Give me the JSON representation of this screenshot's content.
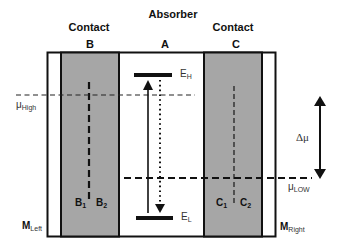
{
  "diagram": {
    "headers": {
      "absorber": "Absorber",
      "contact_left": "Contact",
      "contact_right": "Contact"
    },
    "regions": {
      "B": "B",
      "A": "A",
      "C": "C"
    },
    "energy_levels": {
      "high": {
        "main": "E",
        "sub": "H"
      },
      "low": {
        "main": "E",
        "sub": "L"
      }
    },
    "chemical_potentials": {
      "high": {
        "main": "μ",
        "sub": "High"
      },
      "low": {
        "main": "μ",
        "sub": "LOW"
      },
      "delta": "Δμ"
    },
    "sub_regions": {
      "B1": {
        "main": "B",
        "sub": "1"
      },
      "B2": {
        "main": "B",
        "sub": "2"
      },
      "C1": {
        "main": "C",
        "sub": "1"
      },
      "C2": {
        "main": "C",
        "sub": "2"
      }
    },
    "metals": {
      "left": {
        "main": "M",
        "sub": "Left"
      },
      "right": {
        "main": "M",
        "sub": "Right"
      }
    },
    "colors": {
      "contact_fill": "#a6a6a6",
      "line": "#111111",
      "background": "#ffffff"
    }
  }
}
